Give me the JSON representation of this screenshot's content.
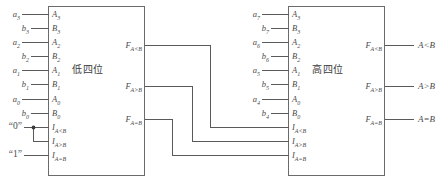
{
  "diagram": {
    "wire_color": "#5a5a5a",
    "box_color": "#6b6b6b",
    "text_color": "#4a4a4a"
  },
  "low_block": {
    "title": "低四位",
    "inputs": [
      {
        "signal": "a",
        "signal_sub": "3",
        "pin": "A",
        "pin_sub": "3"
      },
      {
        "signal": "b",
        "signal_sub": "3",
        "pin": "B",
        "pin_sub": "3"
      },
      {
        "signal": "a",
        "signal_sub": "2",
        "pin": "A",
        "pin_sub": "2"
      },
      {
        "signal": "b",
        "signal_sub": "2",
        "pin": "B",
        "pin_sub": "2"
      },
      {
        "signal": "a",
        "signal_sub": "1",
        "pin": "A",
        "pin_sub": "1"
      },
      {
        "signal": "b",
        "signal_sub": "1",
        "pin": "B",
        "pin_sub": "1"
      },
      {
        "signal": "a",
        "signal_sub": "0",
        "pin": "A",
        "pin_sub": "0"
      },
      {
        "signal": "b",
        "signal_sub": "0",
        "pin": "B",
        "pin_sub": "0"
      }
    ],
    "cascade_inputs": [
      {
        "pin": "I",
        "pin_sub": "A<B",
        "source": "“0”"
      },
      {
        "pin": "I",
        "pin_sub": "A>B",
        "source": ""
      },
      {
        "pin": "I",
        "pin_sub": "A=B",
        "source": "“1”"
      }
    ],
    "outputs": [
      {
        "pin": "F",
        "pin_sub": "A<B"
      },
      {
        "pin": "F",
        "pin_sub": "A>B"
      },
      {
        "pin": "F",
        "pin_sub": "A=B"
      }
    ]
  },
  "high_block": {
    "title": "高四位",
    "inputs": [
      {
        "signal": "a",
        "signal_sub": "7",
        "pin": "A",
        "pin_sub": "3"
      },
      {
        "signal": "b",
        "signal_sub": "7",
        "pin": "B",
        "pin_sub": "3"
      },
      {
        "signal": "a",
        "signal_sub": "6",
        "pin": "A",
        "pin_sub": "2"
      },
      {
        "signal": "b",
        "signal_sub": "6",
        "pin": "B",
        "pin_sub": "2"
      },
      {
        "signal": "a",
        "signal_sub": "5",
        "pin": "A",
        "pin_sub": "1"
      },
      {
        "signal": "b",
        "signal_sub": "5",
        "pin": "B",
        "pin_sub": "1"
      },
      {
        "signal": "a",
        "signal_sub": "4",
        "pin": "A",
        "pin_sub": "0"
      },
      {
        "signal": "b",
        "signal_sub": "4",
        "pin": "B",
        "pin_sub": "0"
      }
    ],
    "cascade_inputs": [
      {
        "pin": "I",
        "pin_sub": "A<B"
      },
      {
        "pin": "I",
        "pin_sub": "A>B"
      },
      {
        "pin": "I",
        "pin_sub": "A=B"
      }
    ],
    "outputs": [
      {
        "pin": "F",
        "pin_sub": "A<B",
        "result": "A<B"
      },
      {
        "pin": "F",
        "pin_sub": "A>B",
        "result": "A>B"
      },
      {
        "pin": "F",
        "pin_sub": "A=B",
        "result": "A=B"
      }
    ]
  }
}
